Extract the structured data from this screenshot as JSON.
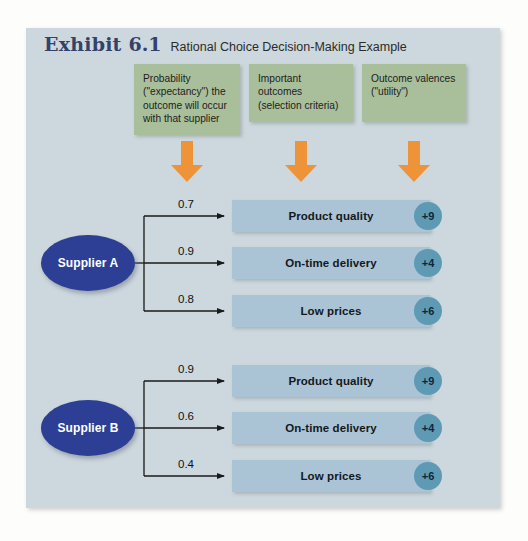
{
  "exhibit": {
    "label": "Exhibit",
    "number": "6.1",
    "subtitle": "Rational Choice Decision-Making Example"
  },
  "column_headers": [
    {
      "id": "probability",
      "text": "Probability (\"expectancy\") the outcome will occur with that supplier",
      "arrow_icon": "down-arrow-icon"
    },
    {
      "id": "outcomes",
      "text": "Important outcomes (selection criteria)",
      "arrow_icon": "down-arrow-icon"
    },
    {
      "id": "valences",
      "text": "Outcome valences (\"utility\")",
      "arrow_icon": "down-arrow-icon"
    }
  ],
  "suppliers": [
    {
      "id": "supplier-a",
      "name": "Supplier A",
      "rows": [
        {
          "probability": "0.7",
          "outcome": "Product quality",
          "valence": "+9"
        },
        {
          "probability": "0.9",
          "outcome": "On-time delivery",
          "valence": "+4"
        },
        {
          "probability": "0.8",
          "outcome": "Low prices",
          "valence": "+6"
        }
      ]
    },
    {
      "id": "supplier-b",
      "name": "Supplier B",
      "rows": [
        {
          "probability": "0.9",
          "outcome": "Product quality",
          "valence": "+9"
        },
        {
          "probability": "0.6",
          "outcome": "On-time delivery",
          "valence": "+4"
        },
        {
          "probability": "0.4",
          "outcome": "Low prices",
          "valence": "+6"
        }
      ]
    }
  ],
  "colors": {
    "panel_background": "#ccd8dd",
    "page_background": "#fdfdfb",
    "header_box": "#a9bf9b",
    "arrow": "#ef9338",
    "supplier_ellipse": "#2c3f94",
    "outcome_bar": "#aac4d6",
    "valence_circle": "#5e9ab4",
    "title_text": "#33416b",
    "connector_line": "#1a1a1a"
  }
}
